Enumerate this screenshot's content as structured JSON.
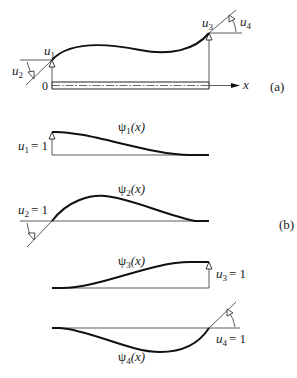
{
  "figure": {
    "panel_a": {
      "label": "(a)",
      "origin_label": "0",
      "axis_label": "x",
      "dof_labels": {
        "u1": {
          "sym": "u",
          "sub": "1"
        },
        "u2": {
          "sym": "u",
          "sub": "2"
        },
        "u3": {
          "sym": "u",
          "sub": "3"
        },
        "u4": {
          "sym": "u",
          "sub": "4"
        }
      }
    },
    "panel_b": {
      "label": "(b)",
      "shapes": [
        {
          "func": "ψ",
          "sub": "1",
          "arg": "(x)",
          "dof": "u",
          "dof_sub": "1",
          "value": "= 1"
        },
        {
          "func": "ψ",
          "sub": "2",
          "arg": "(x)",
          "dof": "u",
          "dof_sub": "2",
          "value": "= 1"
        },
        {
          "func": "ψ",
          "sub": "3",
          "arg": "(x)",
          "dof": "u",
          "dof_sub": "3",
          "value": "= 1"
        },
        {
          "func": "ψ",
          "sub": "4",
          "arg": "(x)",
          "dof": "u",
          "dof_sub": "4",
          "value": "= 1"
        }
      ]
    }
  }
}
